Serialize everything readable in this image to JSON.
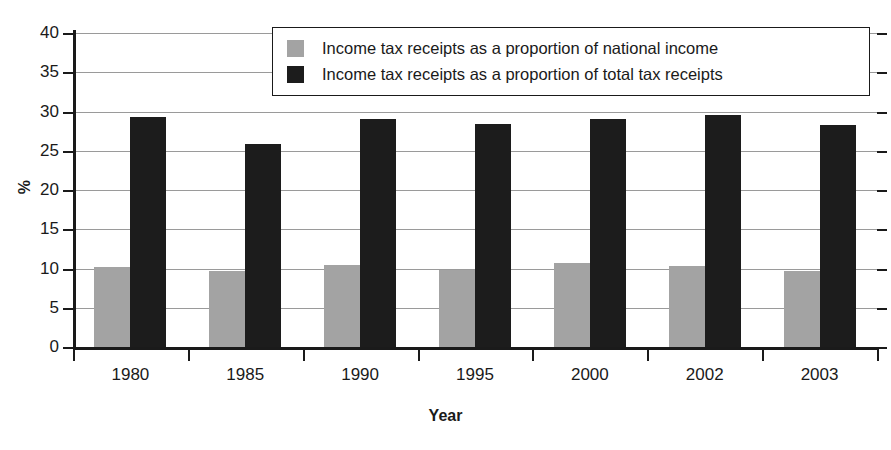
{
  "chart_data": {
    "type": "bar",
    "title": "",
    "xlabel": "Year",
    "ylabel": "%",
    "categories": [
      "1980",
      "1985",
      "1990",
      "1995",
      "2000",
      "2002",
      "2003"
    ],
    "series": [
      {
        "name": "Income tax receipts as a proportion of national income",
        "color": "#a3a3a3",
        "values": [
          10.2,
          9.7,
          10.5,
          9.8,
          10.7,
          10.3,
          9.7
        ]
      },
      {
        "name": "Income tax receipts as a proportion of total tax receipts",
        "color": "#1c1c1c",
        "values": [
          29.3,
          25.8,
          29.1,
          28.4,
          29.0,
          29.5,
          28.3
        ]
      }
    ],
    "ylim": [
      0,
      40
    ],
    "ytick_step": 5,
    "yticks": [
      "0",
      "5",
      "10",
      "15",
      "20",
      "25",
      "30",
      "35",
      "40"
    ],
    "grid": true,
    "legend_position": "top-center"
  },
  "legend": {
    "entries": [
      {
        "label": "Income tax receipts as a proportion of national income",
        "swatch": "#a3a3a3"
      },
      {
        "label": "Income tax receipts as a proportion of total tax receipts",
        "swatch": "#1c1c1c"
      }
    ]
  },
  "axes": {
    "y_title": "%",
    "x_title": "Year"
  }
}
